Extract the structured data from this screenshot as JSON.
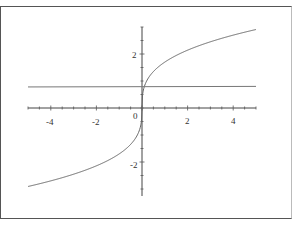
{
  "chart_data": {
    "type": "line",
    "title": "",
    "xlabel": "",
    "ylabel": "",
    "xlim": [
      -5,
      5
    ],
    "ylim": [
      -3.0,
      3.0
    ],
    "grid": false,
    "x_ticks": [
      "-4",
      "-2",
      "0",
      "2",
      "4"
    ],
    "y_ticks": [
      "2",
      "-2"
    ],
    "series": [
      {
        "name": "curve",
        "x": [
          -5,
          -4,
          -3,
          -2,
          -1.5,
          -1,
          -0.6,
          -0.3,
          -0.1,
          0,
          0.1,
          0.3,
          0.6,
          1,
          1.5,
          2,
          3,
          4,
          5
        ],
        "values": [
          -2.91,
          -2.7,
          -2.45,
          -2.14,
          -1.95,
          -1.7,
          -1.43,
          -1.14,
          -0.79,
          0,
          0.79,
          1.14,
          1.43,
          1.7,
          1.95,
          2.14,
          2.45,
          2.7,
          2.91
        ]
      },
      {
        "name": "horizontal-line",
        "x": [
          -5,
          5
        ],
        "values": [
          0.78,
          0.8
        ]
      }
    ]
  },
  "labels": {
    "x_origin": "0",
    "x_neg4": "-4",
    "x_neg2": "-2",
    "x_2": "2",
    "x_4": "4",
    "y_2": "2",
    "y_neg2": "-2"
  }
}
